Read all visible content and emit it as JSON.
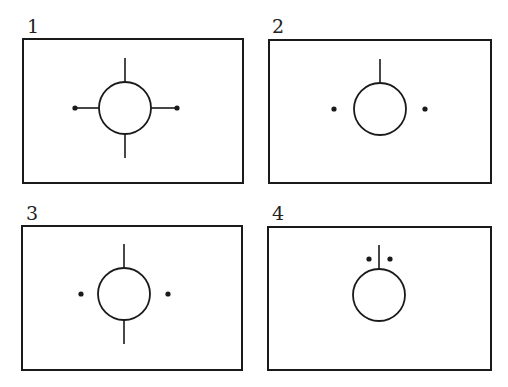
{
  "figure": {
    "panels": [
      {
        "label": "1",
        "elements": [
          "circle",
          "top-line",
          "bottom-line",
          "left-line-with-dot",
          "right-line-with-dot"
        ]
      },
      {
        "label": "2",
        "elements": [
          "circle",
          "top-line",
          "left-dot",
          "right-dot"
        ]
      },
      {
        "label": "3",
        "elements": [
          "circle",
          "top-line",
          "bottom-line",
          "left-dot",
          "right-dot"
        ]
      },
      {
        "label": "4",
        "elements": [
          "circle",
          "top-line",
          "two-dots-beside-top-line"
        ]
      }
    ]
  },
  "colors": {
    "stroke": "#1a1a1a",
    "background": "#ffffff"
  }
}
